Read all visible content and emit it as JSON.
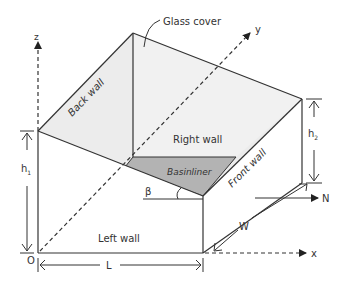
{
  "diagram": {
    "labels": {
      "glass_cover": "Glass cover",
      "back_wall": "Back wall",
      "right_wall": "Right wall",
      "basin_liner": "Basinliner",
      "front_wall": "Front wall",
      "left_wall": "Left wall",
      "axis_z": "z",
      "axis_y": "y",
      "axis_x": "x",
      "origin": "O",
      "north": "N",
      "dim_L": "L",
      "dim_W": "W",
      "dim_h1": "h",
      "dim_h1_sub": "1",
      "dim_h2": "h",
      "dim_h2_sub": "2",
      "angle_beta": "β"
    },
    "colors": {
      "line": "#333333",
      "glass_fill": "#ececec",
      "basin_fill": "#b3b3b3",
      "background": "#ffffff"
    }
  }
}
